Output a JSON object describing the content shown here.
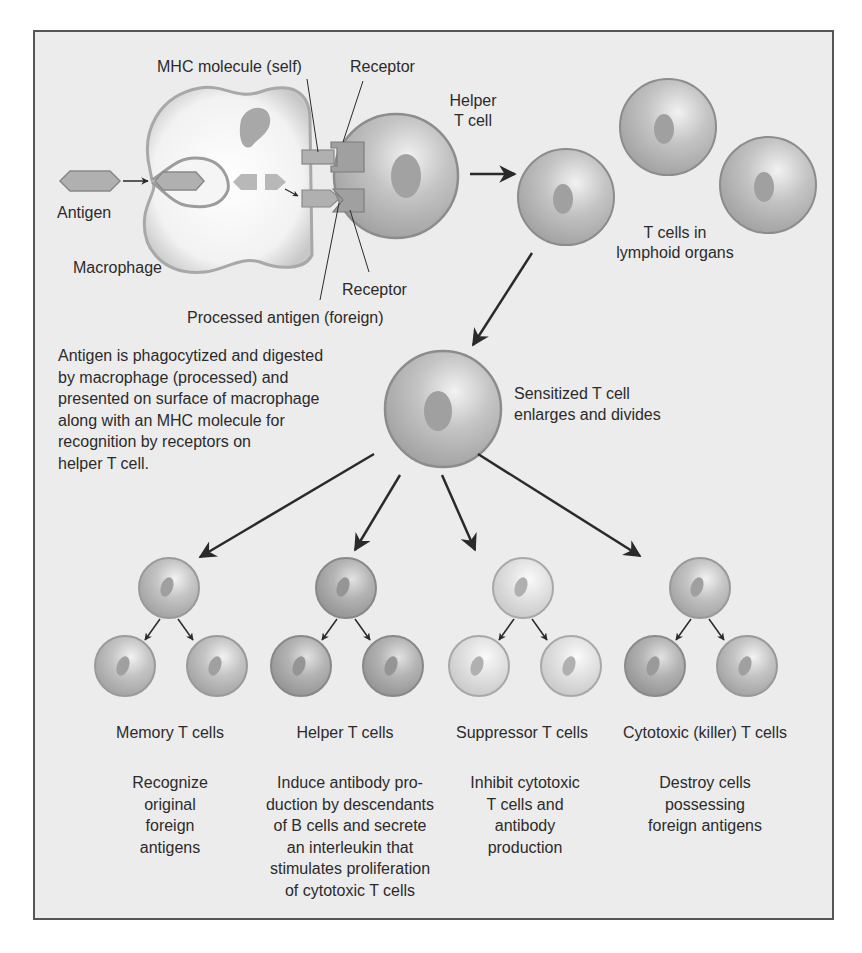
{
  "diagram": {
    "type": "biological process flow",
    "colors": {
      "panel_bg": "#ececec",
      "panel_border": "#555555",
      "cell_fill": "#b8b8b8",
      "cell_light_fill": "#dcdcdc",
      "cell_dark_fill": "#a8a8a8",
      "nucleus": "#9a9a9a",
      "arrow": "#2a2a2a",
      "text": "#2b2b2b"
    }
  },
  "top_section": {
    "labels": {
      "mhc_molecule": "MHC molecule (self)",
      "receptor_top": "Receptor",
      "helper_t_cell": "Helper\nT cell",
      "helper_line1": "Helper",
      "helper_line2": "T cell",
      "antigen": "Antigen",
      "macrophage": "Macrophage",
      "receptor_bottom": "Receptor",
      "processed_antigen": "Processed antigen (foreign)",
      "t_cells_lymphoid_line1": "T cells in",
      "t_cells_lymphoid_line2": "lymphoid organs"
    },
    "explanation": "Antigen is phagocytized and digested\nby macrophage (processed) and\npresented on surface of macrophage\nalong with an MHC molecule for\nrecognition by receptors on\nhelper T cell."
  },
  "middle_section": {
    "sensitized_line1": "Sensitized T cell",
    "sensitized_line2": "enlarges and divides"
  },
  "outcomes": [
    {
      "name": "Memory T cells",
      "description": "Recognize\noriginal\nforeign\nantigens"
    },
    {
      "name": "Helper T cells",
      "description": "Induce antibody pro-\nduction by descendants\nof B cells and secrete\nan interleukin that\nstimulates proliferation\nof cytotoxic T cells"
    },
    {
      "name": "Suppressor T cells",
      "description": "Inhibit cytotoxic\nT cells and\nantibody\nproduction"
    },
    {
      "name": "Cytotoxic (killer) T cells",
      "description": "Destroy cells\npossessing\nforeign antigens"
    }
  ]
}
